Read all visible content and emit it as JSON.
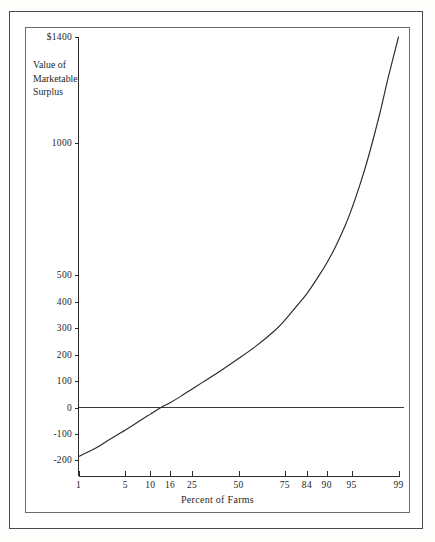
{
  "figure": {
    "y_axis_title_lines": [
      "Value of",
      "Marketable",
      "Surplus"
    ],
    "x_axis_title": "Percent of Farms"
  },
  "chart_data": {
    "type": "line",
    "title": "",
    "subtitle": "",
    "xlabel": "Percent of Farms",
    "ylabel": "Value of Marketable Surplus",
    "grid": false,
    "legend": null,
    "x_scale": "normal-probability",
    "x_tick_labels": [
      "1",
      "5",
      "10",
      "16",
      "25",
      "50",
      "75",
      "84",
      "90",
      "95",
      "99"
    ],
    "x_tick_values": [
      1,
      5,
      10,
      16,
      25,
      50,
      75,
      84,
      90,
      95,
      99
    ],
    "xlim": [
      1,
      99
    ],
    "y_tick_labels": [
      "$1400",
      "1000",
      "500",
      "400",
      "300",
      "200",
      "100",
      "0",
      "-100",
      "-200"
    ],
    "y_tick_values": [
      1400,
      1000,
      500,
      400,
      300,
      200,
      100,
      0,
      -100,
      -200
    ],
    "ylim": [
      -200,
      1400
    ],
    "zero_reference_line": 0,
    "series": [
      {
        "name": "Value of Marketable Surplus",
        "x": [
          1,
          2,
          3,
          5,
          8,
          10,
          13,
          16,
          20,
          25,
          30,
          40,
          50,
          60,
          70,
          75,
          80,
          84,
          88,
          90,
          92,
          94,
          95,
          96,
          97,
          98,
          98.5,
          99
        ],
        "values": [
          -185,
          -150,
          -122,
          -85,
          -45,
          -25,
          0,
          18,
          42,
          70,
          95,
          140,
          185,
          232,
          290,
          330,
          382,
          430,
          500,
          545,
          605,
          690,
          750,
          830,
          940,
          1110,
          1240,
          1400
        ]
      }
    ]
  }
}
